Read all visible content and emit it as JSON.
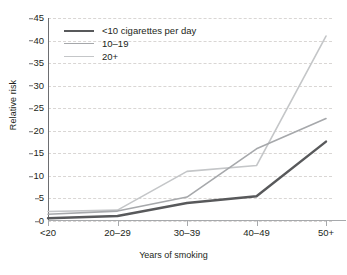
{
  "chart_data": {
    "type": "line",
    "title": "",
    "xlabel": "Years of smoking",
    "ylabel": "Relative risk",
    "categories": [
      "<20",
      "20–29",
      "30–39",
      "40–49",
      "50+"
    ],
    "yticks": [
      0,
      5,
      10,
      15,
      20,
      25,
      30,
      35,
      40,
      45
    ],
    "ylim": [
      0,
      45
    ],
    "grid": "horizontal-dashed",
    "legend_position": "top-left-inside",
    "series": [
      {
        "name": "<10 cigarettes per day",
        "color": "#58595b",
        "width": 2.4,
        "values": [
          0.6,
          1.1,
          4.0,
          5.5,
          17.6
        ]
      },
      {
        "name": "10–19",
        "color": "#a6a8ab",
        "width": 1.6,
        "values": [
          1.5,
          2.2,
          5.3,
          16.0,
          22.7
        ]
      },
      {
        "name": "20+",
        "color": "#c4c6c8",
        "width": 1.6,
        "values": [
          2.1,
          2.4,
          11.0,
          12.3,
          41.0
        ]
      }
    ]
  },
  "axis": {
    "ylabel_text": "Relative risk",
    "xlabel_text": "Years of smoking"
  }
}
